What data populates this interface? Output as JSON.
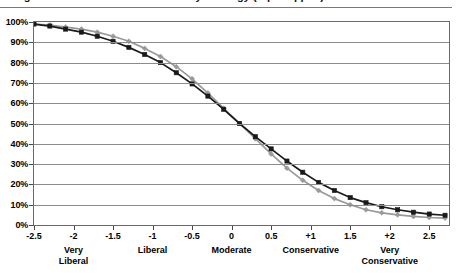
{
  "title": {
    "text": "Figure 1. Cumulative distribution by ideology (top cropped)",
    "visible_fragment": true
  },
  "chart_data": {
    "type": "line",
    "title": "",
    "xlabel": "",
    "ylabel": "",
    "xlim": [
      -2.5,
      2.75
    ],
    "ylim": [
      0,
      1
    ],
    "grid": true,
    "legend_position": "none",
    "y_ticks": [
      "0%",
      "10%",
      "20%",
      "30%",
      "40%",
      "50%",
      "60%",
      "70%",
      "80%",
      "90%",
      "100%"
    ],
    "y_tick_values": [
      0,
      10,
      20,
      30,
      40,
      50,
      60,
      70,
      80,
      90,
      100
    ],
    "x_ticks": [
      "-2.5",
      "-2",
      "-1.5",
      "-1",
      "-0.5",
      "0",
      "0.5",
      "+1",
      "1.5",
      "+2",
      "2.5"
    ],
    "x_tick_values": [
      -2.5,
      -2,
      -1.5,
      -1,
      -0.5,
      0,
      0.5,
      1,
      1.5,
      2,
      2.5
    ],
    "category_labels": [
      {
        "text": "Very\nLiberal",
        "x": -2
      },
      {
        "text": "Liberal",
        "x": -1
      },
      {
        "text": "Moderate",
        "x": 0
      },
      {
        "text": "Conservative",
        "x": 1
      },
      {
        "text": "Very\nConservative",
        "x": 2
      }
    ],
    "x": [
      -2.5,
      -2.3,
      -2.1,
      -1.9,
      -1.7,
      -1.5,
      -1.3,
      -1.1,
      -0.9,
      -0.7,
      -0.5,
      -0.3,
      -0.1,
      0.1,
      0.3,
      0.5,
      0.7,
      0.9,
      1.1,
      1.3,
      1.5,
      1.7,
      1.9,
      2.1,
      2.3,
      2.5,
      2.7
    ],
    "series": [
      {
        "name": "Series 1",
        "color": "#999999",
        "marker": "diamond",
        "values": [
          99,
          98.5,
          97.5,
          96.5,
          95,
          93,
          90.5,
          87,
          83,
          78,
          72,
          65,
          57.5,
          50,
          42.5,
          35,
          28,
          22,
          17,
          13,
          10,
          7.5,
          6,
          5,
          4.2,
          3.7,
          3.4
        ]
      },
      {
        "name": "Series 2",
        "color": "#1a1a1a",
        "marker": "square",
        "values": [
          99,
          98,
          96.5,
          95,
          93,
          90.5,
          87.5,
          84,
          80,
          75,
          69.5,
          63.5,
          57,
          50,
          43.5,
          37.5,
          31.5,
          26,
          21,
          17,
          13.5,
          11,
          9,
          7.5,
          6.3,
          5.4,
          4.8
        ]
      }
    ]
  }
}
